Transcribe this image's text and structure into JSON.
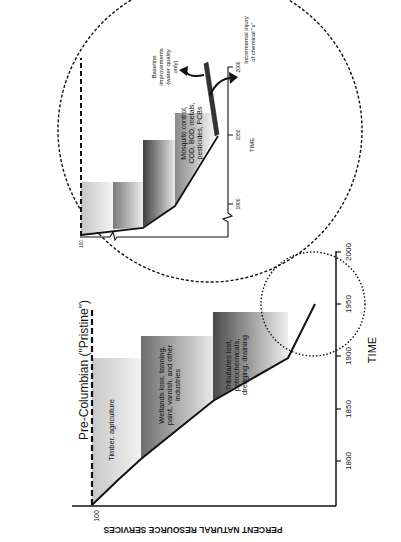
{
  "main_chart": {
    "baseline_label": "Pre-Columbian (\"Pristine\")",
    "y_axis_label": "PERCENT NATURAL RESOURCE SERVICES",
    "y_tick_100": "100",
    "x_axis_label": "TIME",
    "x_ticks": [
      "1800",
      "1850",
      "1900",
      "1950",
      "2000"
    ],
    "bands": [
      {
        "label_lines": [
          "Timber, agriculture"
        ]
      },
      {
        "label_lines": [
          "Wetlands loss, tanning,",
          "paint, varnish, and other",
          "industries"
        ]
      },
      {
        "label_lines": [
          "Tributaries lost,",
          "petrochemicals,",
          "dredging, draining"
        ]
      }
    ]
  },
  "inset": {
    "y_tick_100": "100",
    "x_axis_label": "TIME",
    "x_ticks": [
      "1900",
      "1950",
      "2000"
    ],
    "band_label_lines": [
      "Mosquito control,",
      "COD, BOD, metals,",
      "pesticides, PCBs"
    ],
    "baseline_improvements_lines": [
      "Baseline",
      "improvements",
      "(water quality",
      "only)"
    ],
    "incremental_injury_lines": [
      "Incremental injury",
      "of chemical \"x\""
    ]
  },
  "colors": {
    "ink": "#111111",
    "band_light": "#d4d4d4",
    "band_mid": "#8f8f8f",
    "band_dark": "#5a5a5a"
  }
}
